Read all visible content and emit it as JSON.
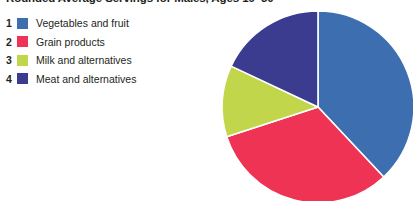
{
  "title": "Rounded Average Servings for Males, Ages 19–30",
  "legend": {
    "items": [
      {
        "index": "1",
        "label": "Vegetables and fruit",
        "color": "#3D6FB0"
      },
      {
        "index": "2",
        "label": "Grain products",
        "color": "#EE3355"
      },
      {
        "index": "3",
        "label": "Milk and alternatives",
        "color": "#C2D64B"
      },
      {
        "index": "4",
        "label": "Meat and alternatives",
        "color": "#3B3B8F"
      }
    ]
  },
  "chart_data": {
    "type": "pie",
    "title": "Rounded Average Servings for Males, Ages 19–30",
    "categories": [
      "Vegetables and fruit",
      "Grain products",
      "Milk and alternatives",
      "Meat and alternatives"
    ],
    "values": [
      38,
      32,
      12,
      18
    ],
    "unit": "percent",
    "colors": [
      "#3D6FB0",
      "#EE3355",
      "#C2D64B",
      "#3B3B8F"
    ],
    "start_angle_deg": 0,
    "direction": "clockwise",
    "legend": "left",
    "grid": false,
    "labels_shown": false,
    "center_px": [
      318,
      107
    ],
    "radius_px": 96
  }
}
